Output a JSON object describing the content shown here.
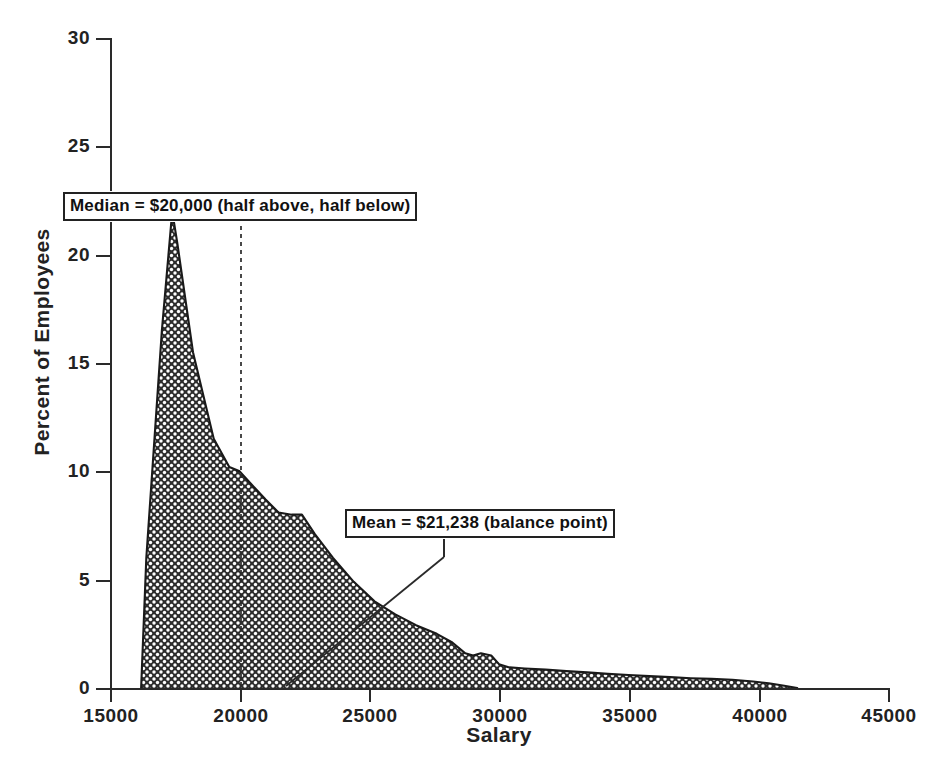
{
  "chart_data": {
    "type": "area",
    "title": "",
    "xlabel": "Salary",
    "ylabel": "Percent of Employees",
    "xlim": [
      15000,
      45000
    ],
    "ylim": [
      0,
      30
    ],
    "xticks": [
      "15000",
      "20000",
      "25000",
      "30000",
      "35000",
      "40000",
      "45000"
    ],
    "yticks": [
      "0",
      "5",
      "10",
      "15",
      "20",
      "25",
      "30"
    ],
    "grid": false,
    "legend": "none",
    "series": [
      {
        "name": "Salary distribution",
        "x": [
          16200,
          16400,
          17000,
          17400,
          17600,
          18200,
          19000,
          19600,
          20000,
          20300,
          21000,
          21500,
          22000,
          22400,
          22900,
          23600,
          24400,
          25200,
          26000,
          26800,
          27600,
          28200,
          28700,
          29000,
          29300,
          29700,
          30000,
          30400,
          31000,
          31800,
          32600,
          33400,
          34200,
          35000,
          35800,
          36600,
          37400,
          38200,
          39000,
          39800,
          40400,
          41000,
          41500
        ],
        "y": [
          0,
          6.0,
          16.5,
          22.0,
          20.5,
          15.5,
          11.5,
          10.2,
          10.0,
          9.6,
          8.7,
          8.1,
          8.0,
          8.0,
          7.1,
          6.0,
          4.9,
          4.0,
          3.4,
          2.9,
          2.5,
          2.1,
          1.6,
          1.5,
          1.6,
          1.5,
          1.1,
          0.95,
          0.9,
          0.85,
          0.78,
          0.72,
          0.65,
          0.6,
          0.55,
          0.5,
          0.45,
          0.42,
          0.38,
          0.3,
          0.22,
          0.1,
          0.0
        ]
      }
    ],
    "annotations": [
      {
        "id": "median",
        "label": "Median = $20,000 (half above, half below)",
        "value": 20000,
        "marker": "vertical-dashed-line"
      },
      {
        "id": "mean",
        "label": "Mean = $21,238 (balance point)",
        "value": 21238,
        "marker": "leader-line-to-axis"
      }
    ],
    "fill_pattern": "cross-hatch",
    "line_color": "#1a1a1a",
    "fill_color": "#2b2b2b"
  },
  "axes": {
    "y": {
      "label": "Percent of Employees",
      "ticks": [
        "0",
        "5",
        "10",
        "15",
        "20",
        "25",
        "30"
      ]
    },
    "x": {
      "label": "Salary",
      "ticks": [
        "15000",
        "20000",
        "25000",
        "30000",
        "35000",
        "40000",
        "45000"
      ]
    }
  },
  "callouts": {
    "median": "Median = $20,000 (half above, half below)",
    "mean": "Mean = $21,238 (balance point)"
  }
}
